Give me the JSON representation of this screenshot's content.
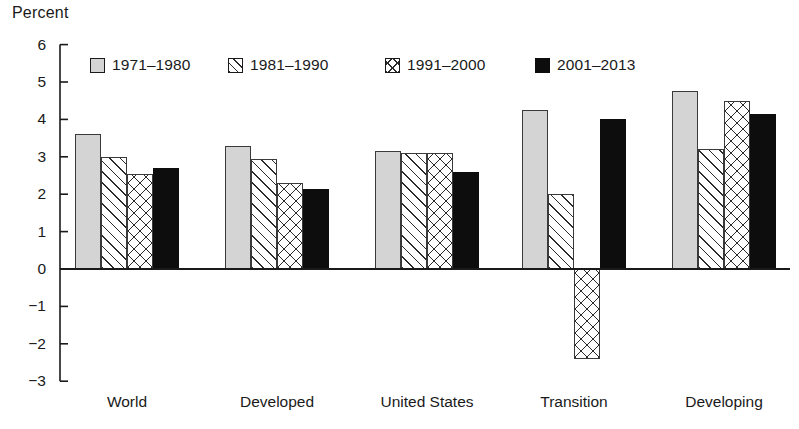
{
  "chart_data": {
    "type": "bar",
    "title": "",
    "subtitle": "",
    "xlabel": "",
    "ylabel": "Percent",
    "ylim": [
      -3,
      6
    ],
    "yticks": [
      6,
      5,
      4,
      3,
      2,
      1,
      0,
      -1,
      -2,
      -3
    ],
    "ytick_labels": [
      "6",
      "5",
      "4",
      "3",
      "2",
      "1",
      "0",
      "−1",
      "−2",
      "−3"
    ],
    "grid": false,
    "legend_position": "top-inside",
    "categories": [
      "World",
      "Developed",
      "United States",
      "Transition",
      "Developing"
    ],
    "series": [
      {
        "name": "1971–1980",
        "fill": "solid-gray",
        "color": "#d4d4d4",
        "values": [
          3.6,
          3.3,
          3.15,
          4.25,
          4.75
        ]
      },
      {
        "name": "1981–1990",
        "fill": "diag",
        "color": "#ffffff",
        "values": [
          3.0,
          2.95,
          3.1,
          2.0,
          3.2
        ]
      },
      {
        "name": "1991–2000",
        "fill": "cross",
        "color": "#ffffff",
        "values": [
          2.55,
          2.3,
          3.1,
          -2.4,
          4.5
        ]
      },
      {
        "name": "2001–2013",
        "fill": "black",
        "color": "#0d0d0d",
        "values": [
          2.7,
          2.15,
          2.6,
          4.0,
          4.15
        ]
      }
    ]
  },
  "colors": {
    "axis": "#1a1a1a",
    "bar_outline": "#3a3a3a",
    "series_1": "#d4d4d4",
    "series_4": "#0d0d0d",
    "background": "#ffffff"
  }
}
